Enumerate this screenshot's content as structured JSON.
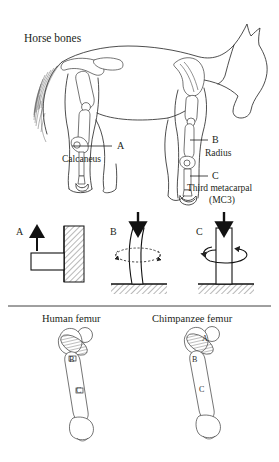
{
  "figure": {
    "title": "Horse bones",
    "panels": [
      "horse-skeleton",
      "loading-diagrams",
      "femur-comparison"
    ]
  },
  "horse": {
    "title": "Horse bones",
    "callouts": [
      {
        "letter": "A",
        "name": "Calcaneus",
        "side": "left",
        "limb": "hind"
      },
      {
        "letter": "B",
        "name": "Radius",
        "side": "right",
        "limb": "fore"
      },
      {
        "letter": "C",
        "name": "Third metacarpal",
        "name2": "(MC3)",
        "side": "right",
        "limb": "fore"
      }
    ]
  },
  "loading": {
    "diagrams": [
      {
        "letter": "A",
        "mode": "bending",
        "arrow": "up",
        "support": "wall-hatched"
      },
      {
        "letter": "B",
        "mode": "buckling",
        "arrow": "down",
        "support": "ground-hatched",
        "rotation": "dashed"
      },
      {
        "letter": "C",
        "mode": "torsion",
        "arrow": "down",
        "support": "ground-hatched",
        "rotation": "solid"
      }
    ]
  },
  "femurs": {
    "items": [
      {
        "title": "Human femur",
        "labels": [
          "B",
          "C"
        ]
      },
      {
        "title": "Chimpanzee femur",
        "labels": [
          "A",
          "B",
          "C"
        ]
      }
    ]
  },
  "colors": {
    "ink": "#231f20",
    "outline": "#2e2e2e",
    "bone": "#ffffff",
    "hatch": "#8a8a8a",
    "arrow": "#111111"
  }
}
